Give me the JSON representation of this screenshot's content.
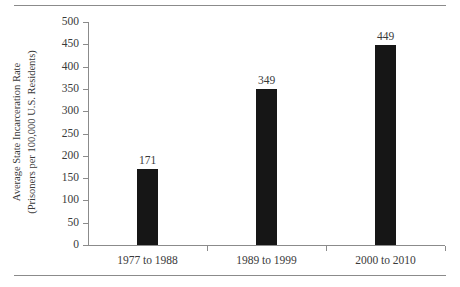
{
  "chart_data": {
    "type": "bar",
    "title": "",
    "xlabel": "",
    "ylabel": "Average State Incarceration Rate (Prisoners per 100,000 U.S. Residents)",
    "ylabel_line1": "Average State Incarceration Rate",
    "ylabel_line2": "(Prisoners per 100,000 U.S. Residents)",
    "categories": [
      "1977 to 1988",
      "1989 to 1999",
      "2000 to 2010"
    ],
    "values": [
      171,
      349,
      449
    ],
    "value_labels": [
      "171",
      "349",
      "449"
    ],
    "ylim": [
      0,
      500
    ],
    "ytick_values": [
      0,
      50,
      100,
      150,
      200,
      250,
      300,
      350,
      400,
      450,
      500
    ],
    "ytick_labels": [
      "0",
      "50",
      "100",
      "150",
      "200",
      "250",
      "300",
      "350",
      "400",
      "450",
      "500"
    ],
    "grid": false,
    "legend": false,
    "bar_color": "#161616",
    "axis_color": "#8b8b8b",
    "text_color": "#3a3a3a",
    "background": "#ffffff"
  },
  "decorations": {
    "top_rule": "horizontal-rule",
    "bottom_rule": "horizontal-rule"
  }
}
